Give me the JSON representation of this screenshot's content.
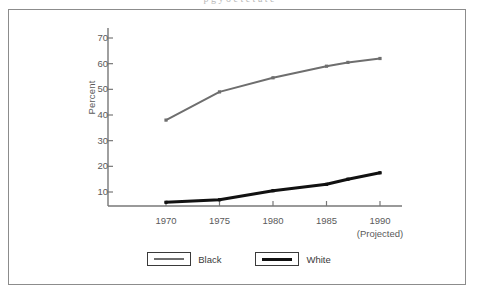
{
  "figure": {
    "cut_off_caption": "p g y o e  t e t a t e",
    "frame_color": "#8c8c8c"
  },
  "chart_data": {
    "type": "line",
    "title": "",
    "xlabel": "",
    "ylabel": "Percent",
    "x": [
      1970,
      1975,
      1980,
      1985,
      1987,
      1990
    ],
    "xtick_labels": [
      "1970",
      "1975",
      "1980",
      "1985",
      "1990"
    ],
    "xtick_values": [
      1970,
      1975,
      1980,
      1985,
      1990
    ],
    "xlim": [
      1967,
      1992
    ],
    "ytick_labels": [
      "10",
      "20",
      "30",
      "40",
      "50",
      "60",
      "70"
    ],
    "ytick_values": [
      10,
      20,
      30,
      40,
      50,
      60,
      70
    ],
    "ylim": [
      3,
      75
    ],
    "grid": false,
    "legend_position": "bottom-center",
    "annotations": [
      "(Projected)"
    ],
    "series": [
      {
        "name": "Black",
        "color": "#6e6e6e",
        "line_width": 2,
        "marker": "square",
        "values": [
          38,
          49,
          54.5,
          59,
          60.5,
          62
        ]
      },
      {
        "name": "White",
        "color": "#111111",
        "line_width": 3,
        "marker": "square",
        "values": [
          6,
          7,
          10.5,
          13,
          15,
          17.5
        ]
      }
    ]
  },
  "legend": {
    "items": [
      {
        "label": "Black",
        "style": "gray"
      },
      {
        "label": "White",
        "style": "black"
      }
    ]
  },
  "axis": {
    "projected_note": "(Projected)"
  }
}
